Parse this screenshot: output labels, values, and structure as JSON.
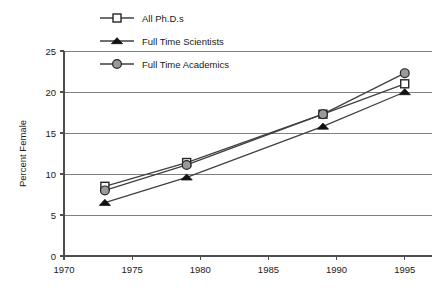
{
  "chart_data": {
    "type": "line",
    "title": "",
    "xlabel": "",
    "ylabel": "Percent Female",
    "xlim": [
      1970,
      1997
    ],
    "ylim": [
      0,
      25
    ],
    "xticks": [
      1970,
      1975,
      1980,
      1985,
      1990,
      1995
    ],
    "yticks": [
      0,
      5,
      10,
      15,
      20,
      25
    ],
    "grid": "horizontal",
    "legend_position": "top-left",
    "x": [
      1973,
      1979,
      1989,
      1995
    ],
    "series": [
      {
        "name": "All Ph.D.s",
        "marker": "open-square",
        "marker_fill": "#ffffff",
        "marker_stroke": "#262626",
        "line_color": "#404040",
        "values": [
          8.5,
          11.4,
          17.3,
          21.0
        ]
      },
      {
        "name": "Full Time Scientists",
        "marker": "filled-triangle",
        "marker_fill": "#111111",
        "marker_stroke": "#111111",
        "line_color": "#404040",
        "values": [
          6.5,
          9.6,
          15.8,
          20.0
        ]
      },
      {
        "name": "Full Time Academics",
        "marker": "filled-circle",
        "marker_fill": "#9a9a9a",
        "marker_stroke": "#262626",
        "line_color": "#404040",
        "values": [
          8.0,
          11.1,
          17.3,
          22.3
        ]
      }
    ]
  },
  "axis": {
    "y_title": "Percent Female",
    "y_tick_labels": [
      "25",
      "20",
      "15",
      "10",
      "5",
      "0"
    ],
    "x_tick_labels": [
      "1970",
      "1975",
      "1980",
      "1985",
      "1990",
      "1995"
    ]
  },
  "legend": {
    "items": [
      {
        "label": "All Ph.D.s",
        "marker": "open-square"
      },
      {
        "label": "Full Time Scientists",
        "marker": "filled-triangle"
      },
      {
        "label": "Full Time Academics",
        "marker": "filled-circle"
      }
    ]
  },
  "colors": {
    "background": "#ffffff",
    "gridline": "#808080",
    "axis": "#4d4d4d",
    "line": "#404040",
    "marker_gray": "#9a9a9a",
    "marker_black": "#111111",
    "text": "#1a1a1a"
  }
}
